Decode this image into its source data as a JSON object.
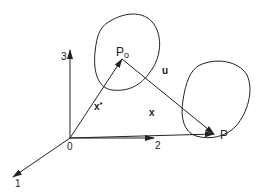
{
  "diagram": {
    "type": "vector-geometry",
    "colors": {
      "stroke": "#222222",
      "background": "#ffffff"
    },
    "origin": {
      "label": "0"
    },
    "axes": [
      {
        "id": "1",
        "label": "1"
      },
      {
        "id": "2",
        "label": "2"
      },
      {
        "id": "3",
        "label": "3"
      }
    ],
    "points": [
      {
        "id": "P0",
        "label": "P",
        "subscript": "o"
      },
      {
        "id": "P",
        "label": "P"
      }
    ],
    "vectors": [
      {
        "id": "x-star",
        "label": "x",
        "superscript": "*",
        "from": "origin",
        "to": "P0"
      },
      {
        "id": "x",
        "label": "x",
        "from": "origin",
        "to": "P"
      },
      {
        "id": "u",
        "label": "u",
        "from": "P0",
        "to": "P"
      }
    ],
    "regions": [
      {
        "id": "region-around-P0",
        "shape": "closed-curve"
      },
      {
        "id": "region-around-P",
        "shape": "closed-curve"
      }
    ]
  }
}
